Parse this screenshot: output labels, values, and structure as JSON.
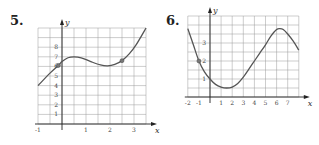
{
  "chart_data": [
    {
      "type": "line",
      "label": "5.",
      "xlabel": "x",
      "ylabel": "y",
      "xlim": [
        -1,
        3.5
      ],
      "ylim": [
        0,
        10
      ],
      "x_ticks": [
        "-1",
        "1",
        "2",
        "3"
      ],
      "y_ticks": [
        "1",
        "2",
        "3",
        "4",
        "5",
        "6",
        "7",
        "8"
      ],
      "grid": true,
      "grid_step_x": 0.5,
      "grid_step_y": 1,
      "points": [
        [
          -1,
          4
        ],
        [
          -0.5,
          5.3
        ],
        [
          -0.15,
          6.1
        ],
        [
          0,
          6.5
        ],
        [
          0.25,
          6.9
        ],
        [
          0.5,
          7
        ],
        [
          0.8,
          6.9
        ],
        [
          1.2,
          6.5
        ],
        [
          1.6,
          6.15
        ],
        [
          1.9,
          6.05
        ],
        [
          2.2,
          6.2
        ],
        [
          2.5,
          6.6
        ],
        [
          2.8,
          7.3
        ],
        [
          3.1,
          8.3
        ],
        [
          3.5,
          10
        ]
      ],
      "marked_points": [
        [
          -0.15,
          6.1
        ],
        [
          2.5,
          6.6
        ]
      ]
    },
    {
      "type": "line",
      "label": "6.",
      "xlabel": "x",
      "ylabel": "y",
      "xlim": [
        -2,
        8
      ],
      "ylim": [
        0,
        4.5
      ],
      "x_ticks": [
        "-2",
        "-1",
        "1",
        "2",
        "3",
        "4",
        "5",
        "6",
        "7"
      ],
      "y_ticks": [
        "1",
        "2",
        "3"
      ],
      "grid": true,
      "grid_step_x": 1,
      "grid_step_y": 0.5,
      "points": [
        [
          -2,
          3.8
        ],
        [
          -1.5,
          2.9
        ],
        [
          -1,
          2.0
        ],
        [
          -0.5,
          1.4
        ],
        [
          0,
          1.0
        ],
        [
          0.5,
          0.7
        ],
        [
          1,
          0.55
        ],
        [
          1.5,
          0.5
        ],
        [
          2,
          0.55
        ],
        [
          2.5,
          0.75
        ],
        [
          3,
          1.1
        ],
        [
          3.5,
          1.55
        ],
        [
          4,
          2.0
        ],
        [
          4.5,
          2.45
        ],
        [
          5,
          2.9
        ],
        [
          5.5,
          3.4
        ],
        [
          6,
          3.75
        ],
        [
          6.3,
          3.8
        ],
        [
          6.6,
          3.75
        ],
        [
          7,
          3.5
        ],
        [
          7.5,
          3.1
        ],
        [
          8,
          2.6
        ]
      ],
      "marked_points": [
        [
          -1,
          2.0
        ]
      ]
    }
  ]
}
